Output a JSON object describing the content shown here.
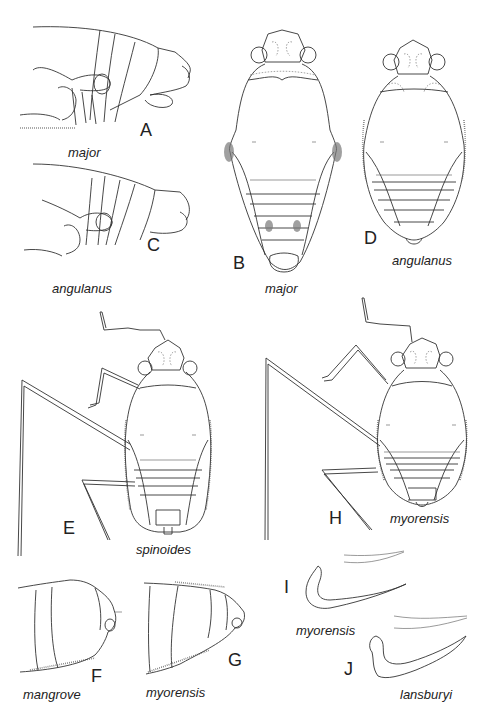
{
  "figure": {
    "panels": [
      {
        "id": "A",
        "view": "lateral abdomen apex",
        "species": "major"
      },
      {
        "id": "B",
        "view": "dorsal habitus",
        "species": "major"
      },
      {
        "id": "C",
        "view": "lateral abdomen apex",
        "species": "angulanus"
      },
      {
        "id": "D",
        "view": "dorsal habitus",
        "species": "angulanus"
      },
      {
        "id": "E",
        "view": "dorsal habitus with legs",
        "species": "spinoides"
      },
      {
        "id": "H",
        "view": "dorsal habitus with legs",
        "species": "myorensis"
      },
      {
        "id": "F",
        "view": "lateral abdomen apex",
        "species": "mangrove"
      },
      {
        "id": "G",
        "view": "lateral abdomen apex",
        "species": "myorensis"
      },
      {
        "id": "I",
        "view": "paramere",
        "species": "myorensis"
      },
      {
        "id": "J",
        "view": "paramere",
        "species": "lansburyi"
      }
    ],
    "line_color": "#333333",
    "background": "#ffffff"
  }
}
